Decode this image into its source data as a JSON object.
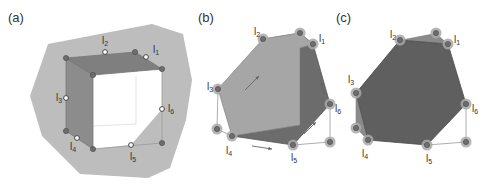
{
  "figure": {
    "width": 492,
    "height": 191,
    "colors": {
      "background_region": "#bdbdbd",
      "cube_top_face": "#7f7f7f",
      "cube_left_face": "#8c8c8c",
      "cube_interior": "#ffffff",
      "edge_thin": "#999999",
      "vertex_fill": "#6e6e6e",
      "vertex_halo": "#a8a8a8",
      "polygon_b_light": "#a6a6a6",
      "polygon_b_dark": "#6c6c6c",
      "polygon_c": "#5f5f5f",
      "text": "#333333"
    },
    "panels": [
      {
        "id": "a",
        "label": "(a)",
        "label_pos": [
          8,
          22
        ],
        "region_polygon": [
          [
            48,
            44
          ],
          [
            152,
            24
          ],
          [
            183,
            34
          ],
          [
            192,
            80
          ],
          [
            186,
            120
          ],
          [
            170,
            168
          ],
          [
            148,
            178
          ],
          [
            80,
            174
          ],
          [
            42,
            136
          ],
          [
            30,
            96
          ]
        ],
        "top_face": [
          [
            66,
            58
          ],
          [
            135,
            52
          ],
          [
            162,
            69
          ],
          [
            93,
            75
          ]
        ],
        "left_face": [
          [
            66,
            58
          ],
          [
            93,
            75
          ],
          [
            93,
            149
          ],
          [
            66,
            131
          ]
        ],
        "interior": [
          [
            93,
            75
          ],
          [
            162,
            69
          ],
          [
            162,
            109
          ],
          [
            131,
            145
          ],
          [
            93,
            149
          ]
        ],
        "hidden_edges": [
          [
            [
              93,
              126
            ],
            [
              136,
              124
            ]
          ],
          [
            [
              136,
              124
            ],
            [
              136,
              76
            ]
          ]
        ],
        "front_edges": [
          [
            [
              93,
              149
            ],
            [
              162,
              143
            ]
          ],
          [
            [
              162,
              143
            ],
            [
              162,
              69
            ]
          ]
        ],
        "corner_vertices": [
          [
            66,
            58
          ],
          [
            135,
            52
          ],
          [
            162,
            69
          ],
          [
            93,
            75
          ],
          [
            66,
            131
          ],
          [
            93,
            149
          ],
          [
            162,
            143
          ]
        ],
        "labeled_vertices": [
          {
            "name": "l",
            "sub": "1",
            "pt": [
              146,
              57
            ],
            "text_pos": [
              153,
              53
            ]
          },
          {
            "name": "l",
            "sub": "2",
            "pt": [
              105,
              52
            ],
            "text_pos": [
              102,
              44
            ]
          },
          {
            "name": "l",
            "sub": "3",
            "pt": [
              66,
              98
            ],
            "text_pos": [
              56,
              101
            ]
          },
          {
            "name": "l",
            "sub": "4",
            "pt": [
              77,
              138
            ],
            "text_pos": [
              70,
              150
            ]
          },
          {
            "name": "l",
            "sub": "5",
            "pt": [
              131,
              145
            ],
            "text_pos": [
              130,
              160
            ]
          },
          {
            "name": "l",
            "sub": "6",
            "pt": [
              162,
              109
            ],
            "text_pos": [
              168,
              112
            ]
          }
        ]
      },
      {
        "id": "b",
        "label": "(b)",
        "label_pos": [
          198,
          22
        ],
        "light_polygon": [
          [
            263,
            39
          ],
          [
            300,
            33
          ],
          [
            313,
            44
          ],
          [
            300,
            48
          ],
          [
            300,
            125
          ],
          [
            232,
            136
          ],
          [
            218,
            89
          ]
        ],
        "dark_polygon": [
          [
            263,
            39
          ],
          [
            313,
            44
          ],
          [
            330,
            104
          ],
          [
            293,
            145
          ],
          [
            232,
            136
          ],
          [
            300,
            125
          ],
          [
            300,
            48
          ],
          [
            263,
            39
          ]
        ],
        "thin_edges": [
          [
            [
              218,
              89
            ],
            [
              217,
              129
            ]
          ],
          [
            [
              217,
              129
            ],
            [
              232,
              136
            ]
          ],
          [
            [
              330,
              104
            ],
            [
              330,
              142
            ]
          ],
          [
            [
              330,
              142
            ],
            [
              293,
              145
            ]
          ],
          [
            [
              263,
              39
            ],
            [
              300,
              33
            ]
          ],
          [
            [
              300,
              33
            ],
            [
              313,
              44
            ]
          ]
        ],
        "halo_vertices": [
          [
            300,
            33
          ],
          [
            217,
            129
          ],
          [
            330,
            142
          ]
        ],
        "labeled_vertices": [
          {
            "name": "l",
            "sub": "1",
            "pt": [
              313,
              44
            ],
            "text_pos": [
              319,
              42
            ]
          },
          {
            "name": "l",
            "sub": "2",
            "pt": [
              263,
              39
            ],
            "text_pos": [
              254,
              35
            ]
          },
          {
            "name": "l",
            "sub": "3",
            "pt": [
              218,
              89
            ],
            "text_pos": [
              207,
              90
            ]
          },
          {
            "name": "l",
            "sub": "4",
            "pt": [
              232,
              136
            ],
            "text_pos": [
              226,
              154
            ]
          },
          {
            "name": "l",
            "sub": "5",
            "pt": [
              293,
              145
            ],
            "text_pos": [
              291,
              161
            ]
          },
          {
            "name": "l",
            "sub": "6",
            "pt": [
              330,
              104
            ],
            "text_pos": [
              335,
              112
            ]
          }
        ],
        "arrows": [
          {
            "from": [
              245,
              90
            ],
            "to": [
              259,
              76
            ]
          },
          {
            "from": [
              324,
              94
            ],
            "to": [
              321,
              82
            ]
          },
          {
            "from": [
              252,
              146
            ],
            "to": [
              272,
              149
            ]
          },
          {
            "from": [
              304,
              134
            ],
            "to": [
              316,
              122
            ]
          }
        ]
      },
      {
        "id": "c",
        "label": "(c)",
        "label_pos": [
          336,
          22
        ],
        "polygon": [
          [
            400,
            40
          ],
          [
            448,
            44
          ],
          [
            466,
            104
          ],
          [
            427,
            145
          ],
          [
            368,
            140
          ],
          [
            356,
            93
          ]
        ],
        "top_sliver": [
          [
            400,
            40
          ],
          [
            436,
            33
          ],
          [
            448,
            44
          ]
        ],
        "left_sliver": [
          [
            356,
            93
          ],
          [
            356,
            128
          ],
          [
            368,
            140
          ]
        ],
        "thin_edges": [
          [
            [
              466,
              104
            ],
            [
              466,
              142
            ]
          ],
          [
            [
              466,
              142
            ],
            [
              427,
              145
            ]
          ],
          [
            [
              356,
              93
            ],
            [
              356,
              128
            ]
          ],
          [
            [
              356,
              128
            ],
            [
              368,
              140
            ]
          ]
        ],
        "halo_vertices": [
          [
            436,
            33
          ],
          [
            356,
            128
          ],
          [
            466,
            142
          ]
        ],
        "labeled_vertices": [
          {
            "name": "l",
            "sub": "1",
            "pt": [
              448,
              44
            ],
            "text_pos": [
              454,
              43
            ]
          },
          {
            "name": "l",
            "sub": "2",
            "pt": [
              400,
              40
            ],
            "text_pos": [
              390,
              38
            ]
          },
          {
            "name": "l",
            "sub": "3",
            "pt": [
              356,
              93
            ],
            "text_pos": [
              348,
              83
            ]
          },
          {
            "name": "l",
            "sub": "4",
            "pt": [
              368,
              140
            ],
            "text_pos": [
              362,
              157
            ]
          },
          {
            "name": "l",
            "sub": "5",
            "pt": [
              427,
              145
            ],
            "text_pos": [
              426,
              162
            ]
          },
          {
            "name": "l",
            "sub": "6",
            "pt": [
              466,
              104
            ],
            "text_pos": [
              472,
              112
            ]
          }
        ]
      }
    ]
  }
}
